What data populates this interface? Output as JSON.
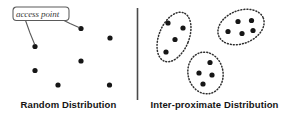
{
  "figure": {
    "width": 286,
    "height": 119,
    "background_color": "#ffffff",
    "divider": {
      "name": "vertical-divider",
      "x": 137.5,
      "y_top": 8,
      "y_bottom": 100,
      "color": "#4a4a4a",
      "width": 1.6
    },
    "callout": {
      "label": "access point",
      "box": {
        "x": 13,
        "y": 7,
        "width": 56,
        "height": 13.5,
        "radius": 3
      },
      "stroke_color": "#5a5a5a",
      "text_color": "#3a3a3a",
      "pointers": [
        {
          "name": "callout-pointer-down",
          "from_x": 25,
          "from_y": 20.5,
          "mid_x": 31,
          "mid_y": 34,
          "to_x": 34.5,
          "to_y": 45.5
        },
        {
          "name": "callout-pointer-right",
          "from_x": 62,
          "from_y": 20.5,
          "mid_x": 70,
          "mid_y": 24,
          "to_x": 79.5,
          "to_y": 28.5
        }
      ]
    },
    "panels": [
      {
        "id": "left-panel",
        "caption": "Random Distribution",
        "caption_x": 68,
        "caption_y": 104,
        "dot_color": "#161616",
        "dot_radius": 2.6,
        "points": [
          {
            "x": 81,
            "y": 28.5
          },
          {
            "x": 110,
            "y": 38
          },
          {
            "x": 35,
            "y": 46.5
          },
          {
            "x": 81,
            "y": 61
          },
          {
            "x": 35,
            "y": 70.5
          },
          {
            "x": 58,
            "y": 85
          },
          {
            "x": 109.5,
            "y": 85
          }
        ]
      },
      {
        "id": "right-panel",
        "caption": "Inter-proximate Distribution",
        "caption_x": 214,
        "caption_y": 104,
        "dot_color": "#161616",
        "dot_radius": 2.6,
        "clusters": [
          {
            "name": "cluster-left",
            "ellipse": {
              "cx": 174,
              "cy": 37,
              "rx": 15,
              "ry": 26,
              "rotation": 22
            },
            "points": [
              {
                "x": 168,
                "y": 23
              },
              {
                "x": 183,
                "y": 28
              },
              {
                "x": 175,
                "y": 39.5
              },
              {
                "x": 166,
                "y": 52
              }
            ]
          },
          {
            "name": "cluster-top-right",
            "ellipse": {
              "cx": 241,
              "cy": 27,
              "rx": 24,
              "ry": 16.5,
              "rotation": -22
            },
            "points": [
              {
                "x": 238,
                "y": 21.5
              },
              {
                "x": 251.5,
                "y": 20.5
              },
              {
                "x": 228,
                "y": 31.5
              },
              {
                "x": 242,
                "y": 33.5
              },
              {
                "x": 253,
                "y": 30.5
              }
            ]
          },
          {
            "name": "cluster-bottom",
            "ellipse": {
              "cx": 205.5,
              "cy": 73,
              "rx": 17.5,
              "ry": 21,
              "rotation": -12
            },
            "points": [
              {
                "x": 210,
                "y": 62.5
              },
              {
                "x": 199,
                "y": 73
              },
              {
                "x": 212,
                "y": 75
              },
              {
                "x": 203,
                "y": 84
              }
            ]
          }
        ],
        "cluster_outline": {
          "color": "#2e2e2e",
          "style": "dotted",
          "dash": "0.9 2.1",
          "width": 1.5
        }
      }
    ]
  }
}
